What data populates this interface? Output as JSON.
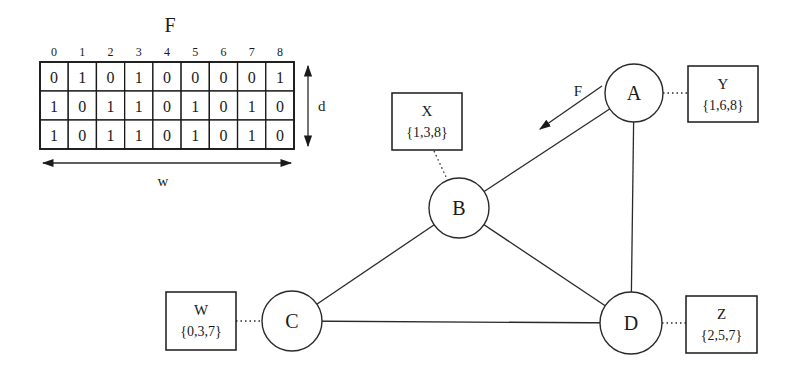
{
  "table": {
    "title": "F",
    "column_indices": [
      "0",
      "1",
      "2",
      "3",
      "4",
      "5",
      "6",
      "7",
      "8"
    ],
    "rows": [
      [
        "0",
        "1",
        "0",
        "1",
        "0",
        "0",
        "0",
        "0",
        "1"
      ],
      [
        "1",
        "0",
        "1",
        "1",
        "0",
        "1",
        "0",
        "1",
        "0"
      ],
      [
        "1",
        "0",
        "1",
        "1",
        "0",
        "1",
        "0",
        "1",
        "0"
      ]
    ],
    "width_label": "w",
    "depth_label": "d"
  },
  "graph": {
    "nodes": [
      {
        "id": "A",
        "label": "A",
        "cx": 634,
        "cy": 93,
        "r": 29
      },
      {
        "id": "B",
        "label": "B",
        "cx": 459,
        "cy": 208,
        "r": 30
      },
      {
        "id": "C",
        "label": "C",
        "cx": 292,
        "cy": 321,
        "r": 30
      },
      {
        "id": "D",
        "label": "D",
        "cx": 631,
        "cy": 323,
        "r": 31
      }
    ],
    "edges": [
      {
        "from": "A",
        "to": "B"
      },
      {
        "from": "A",
        "to": "D"
      },
      {
        "from": "B",
        "to": "C"
      },
      {
        "from": "B",
        "to": "D"
      },
      {
        "from": "C",
        "to": "D"
      }
    ],
    "flow_arrow": {
      "label": "F",
      "x1": 602,
      "y1": 86,
      "x2": 540,
      "y2": 129,
      "label_x": 578,
      "label_y": 96
    },
    "sets": [
      {
        "name": "Y",
        "values": "{1,6,8}",
        "node": "A",
        "x": 688,
        "y": 66,
        "w": 70,
        "h": 56,
        "dot": [
          663,
          93,
          688,
          93
        ]
      },
      {
        "name": "X",
        "values": "{1,3,8}",
        "node": "B",
        "x": 392,
        "y": 93,
        "w": 70,
        "h": 57,
        "dot": [
          434,
          151,
          447,
          179
        ]
      },
      {
        "name": "W",
        "values": "{0,3,7}",
        "node": "C",
        "x": 166,
        "y": 292,
        "w": 70,
        "h": 58,
        "dot": [
          236,
          321,
          262,
          321
        ]
      },
      {
        "name": "Z",
        "values": "{2,5,7}",
        "node": "D",
        "x": 686,
        "y": 296,
        "w": 71,
        "h": 57,
        "dot": [
          662,
          323,
          686,
          323
        ]
      }
    ]
  }
}
